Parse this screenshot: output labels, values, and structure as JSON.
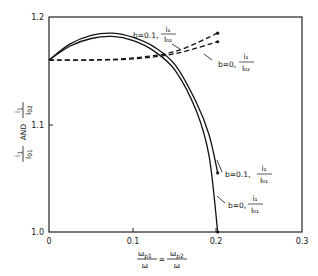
{
  "chart_data": {
    "type": "line",
    "title": "",
    "xlabel": "ω_p1/ω = ω_p2/ω",
    "ylabel": "i1/I01 AND i1/I02",
    "xlim": [
      0,
      0.3
    ],
    "ylim": [
      1.0,
      1.2
    ],
    "grid": false,
    "x_ticks": [
      "0",
      "0.1",
      "0.2",
      "0.3"
    ],
    "y_ticks": [
      "1.0",
      "1.1",
      "1.2"
    ],
    "series": [
      {
        "name": "b=0.1, i1/I02",
        "style": "dashed",
        "x": [
          0,
          0.05,
          0.1,
          0.15,
          0.2
        ],
        "y": [
          1.16,
          1.16,
          1.162,
          1.168,
          1.185
        ]
      },
      {
        "name": "b=0, i1/I02",
        "style": "dashed",
        "x": [
          0,
          0.05,
          0.1,
          0.15,
          0.2
        ],
        "y": [
          1.16,
          1.16,
          1.161,
          1.166,
          1.177
        ]
      },
      {
        "name": "b=0.1, i1/I01",
        "style": "solid",
        "x": [
          0,
          0.025,
          0.05,
          0.075,
          0.1,
          0.125,
          0.15,
          0.175,
          0.19,
          0.2
        ],
        "y": [
          1.16,
          1.175,
          1.183,
          1.185,
          1.181,
          1.172,
          1.155,
          1.12,
          1.09,
          1.055
        ]
      },
      {
        "name": "b=0, i1/I01",
        "style": "solid",
        "x": [
          0,
          0.025,
          0.05,
          0.075,
          0.1,
          0.125,
          0.15,
          0.175,
          0.19,
          0.2
        ],
        "y": [
          1.16,
          1.173,
          1.18,
          1.182,
          1.178,
          1.168,
          1.15,
          1.112,
          1.07,
          1.0
        ]
      }
    ],
    "annotations": [
      {
        "text": "b=0.1,",
        "frac_num": "i1",
        "frac_den": "I02"
      },
      {
        "text": "b=0,",
        "frac_num": "i1",
        "frac_den": "I02"
      },
      {
        "text": "b=0.1,",
        "frac_num": "i1",
        "frac_den": "I01"
      },
      {
        "text": "b=0,",
        "frac_num": "i1",
        "frac_den": "I01"
      }
    ]
  },
  "axis": {
    "x_ticks": [
      "0",
      "0.1",
      "0.2",
      "0.3"
    ],
    "y_ticks": [
      "1.0",
      "1.1",
      "1.2"
    ],
    "xlabel_left_num": "ω",
    "xlabel_left_sub": "p1",
    "xlabel_left_den": "ω",
    "xlabel_eq": "=",
    "xlabel_right_num": "ω",
    "xlabel_right_sub": "p2",
    "xlabel_right_den": "ω",
    "ylabel_a_num": "i",
    "ylabel_a_num_sub": "1",
    "ylabel_a_den": "I",
    "ylabel_a_den_sub": "01",
    "ylabel_and": "AND",
    "ylabel_b_num": "i",
    "ylabel_b_num_sub": "1",
    "ylabel_b_den": "I",
    "ylabel_b_den_sub": "02"
  },
  "labels": {
    "l1_text": "b=0.1,",
    "l1_num": "i₁",
    "l1_den": "I₀₂",
    "l2_text": "b=0,",
    "l2_num": "i₁",
    "l2_den": "I₀₂",
    "l3_text": "b=0.1,",
    "l3_num": "i₁",
    "l3_den": "I₀₁",
    "l4_text": "b=0,",
    "l4_num": "i₁",
    "l4_den": "I₀₁"
  }
}
